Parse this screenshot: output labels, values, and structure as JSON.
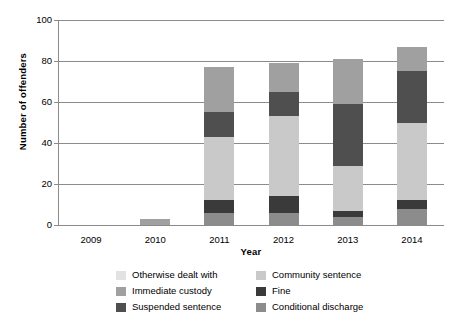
{
  "chart_data": {
    "type": "bar",
    "subtype": "stacked-bar",
    "title": "",
    "xlabel": "Year",
    "ylabel": "Number of offenders",
    "categories": [
      "2009",
      "2010",
      "2011",
      "2012",
      "2013",
      "2014"
    ],
    "ylim": [
      0,
      100
    ],
    "yticks": [
      0,
      20,
      40,
      60,
      80,
      100
    ],
    "ytick_labels": [
      "0",
      "20",
      "40",
      "60",
      "80",
      "100"
    ],
    "grid": true,
    "legend_position": "bottom",
    "stack_order_bottom_to_top": [
      "Conditional discharge",
      "Fine",
      "Community sentence",
      "Suspended sentence",
      "Immediate custody",
      "Otherwise dealt with"
    ],
    "series": [
      {
        "name": "Conditional discharge",
        "color": "#8c8c8c",
        "values": [
          0,
          0,
          6,
          6,
          4,
          8
        ]
      },
      {
        "name": "Fine",
        "color": "#3a3a3a",
        "values": [
          0,
          0,
          6,
          8,
          3,
          4
        ]
      },
      {
        "name": "Community sentence",
        "color": "#c9c9c9",
        "values": [
          0,
          0,
          31,
          39,
          22,
          38
        ]
      },
      {
        "name": "Suspended sentence",
        "color": "#4f4f4f",
        "values": [
          0,
          0,
          12,
          12,
          30,
          25
        ]
      },
      {
        "name": "Immediate custody",
        "color": "#a0a0a0",
        "values": [
          0,
          3,
          22,
          14,
          22,
          12
        ]
      },
      {
        "name": "Otherwise dealt with",
        "color": "#e2e2e2",
        "values": [
          0,
          0,
          0,
          0,
          0,
          0
        ]
      }
    ],
    "totals": [
      0,
      3,
      77,
      79,
      81,
      87
    ],
    "annotations": []
  },
  "legend": {
    "items": [
      {
        "label": "Otherwise dealt with",
        "color": "#e2e2e2"
      },
      {
        "label": "Community sentence",
        "color": "#c9c9c9"
      },
      {
        "label": "Immediate custody",
        "color": "#a0a0a0"
      },
      {
        "label": "Fine",
        "color": "#3a3a3a"
      },
      {
        "label": "Suspended sentence",
        "color": "#4f4f4f"
      },
      {
        "label": "Conditional discharge",
        "color": "#8c8c8c"
      }
    ]
  },
  "colors": {
    "axis": "#8b8b8b",
    "text": "#000000",
    "background": "#ffffff"
  }
}
